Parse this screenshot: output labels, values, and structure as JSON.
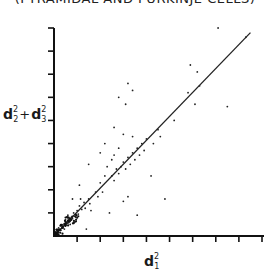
{
  "chart_data": {
    "type": "scatter",
    "title": "(PYRAMIDAL AND PURKINJE CELLS)",
    "xlabel": "d1^2",
    "ylabel": "d2^2 + d3^2",
    "xlim": [
      0,
      9
    ],
    "ylim": [
      0,
      9
    ],
    "x_ticks_count": 9,
    "y_ticks_count": 9,
    "tick_labels": "none",
    "grid": false,
    "legend": "none",
    "reference_line": {
      "type": "identity",
      "from": [
        0,
        0
      ],
      "to": [
        8.5,
        8.8
      ]
    },
    "points": [
      [
        0.1,
        0.1
      ],
      [
        0.15,
        0.2
      ],
      [
        0.2,
        0.15
      ],
      [
        0.25,
        0.3
      ],
      [
        0.3,
        0.25
      ],
      [
        0.35,
        0.4
      ],
      [
        0.4,
        0.35
      ],
      [
        0.45,
        0.5
      ],
      [
        0.5,
        0.45
      ],
      [
        0.55,
        0.6
      ],
      [
        0.6,
        0.55
      ],
      [
        0.65,
        0.7
      ],
      [
        0.7,
        0.65
      ],
      [
        0.75,
        0.8
      ],
      [
        0.8,
        0.75
      ],
      [
        0.3,
        0.45
      ],
      [
        0.45,
        0.3
      ],
      [
        0.2,
        0.35
      ],
      [
        0.5,
        0.7
      ],
      [
        0.7,
        0.5
      ],
      [
        0.85,
        1.0
      ],
      [
        0.9,
        0.85
      ],
      [
        1.0,
        1.1
      ],
      [
        1.05,
        0.95
      ],
      [
        1.1,
        1.3
      ],
      [
        1.2,
        1.15
      ],
      [
        1.3,
        1.45
      ],
      [
        1.35,
        1.2
      ],
      [
        1.5,
        1.6
      ],
      [
        1.55,
        1.4
      ],
      [
        0.6,
        0.9
      ],
      [
        0.9,
        0.6
      ],
      [
        1.15,
        1.6
      ],
      [
        1.6,
        1.1
      ],
      [
        1.8,
        1.9
      ],
      [
        1.9,
        1.7
      ],
      [
        2.0,
        2.3
      ],
      [
        2.1,
        1.9
      ],
      [
        1.4,
        0.3
      ],
      [
        2.4,
        1.0
      ],
      [
        2.5,
        2.6
      ],
      [
        2.6,
        2.4
      ],
      [
        2.7,
        2.9
      ],
      [
        2.8,
        2.7
      ],
      [
        2.9,
        3.0
      ],
      [
        3.0,
        3.2
      ],
      [
        3.1,
        2.9
      ],
      [
        3.2,
        3.4
      ],
      [
        3.3,
        3.1
      ],
      [
        3.4,
        3.6
      ],
      [
        2.2,
        2.6
      ],
      [
        2.3,
        3.0
      ],
      [
        2.5,
        3.3
      ],
      [
        2.0,
        3.6
      ],
      [
        2.2,
        4.0
      ],
      [
        3.5,
        3.3
      ],
      [
        3.6,
        3.8
      ],
      [
        3.7,
        3.5
      ],
      [
        3.8,
        4.0
      ],
      [
        3.9,
        3.7
      ],
      [
        3.2,
        1.7
      ],
      [
        3.0,
        4.4
      ],
      [
        3.4,
        4.3
      ],
      [
        2.8,
        3.8
      ],
      [
        2.6,
        3.5
      ],
      [
        4.2,
        2.6
      ],
      [
        4.0,
        4.2
      ],
      [
        4.3,
        4.0
      ],
      [
        4.5,
        4.6
      ],
      [
        4.6,
        4.3
      ],
      [
        2.8,
        6.0
      ],
      [
        3.2,
        6.6
      ],
      [
        3.4,
        6.3
      ],
      [
        3.1,
        5.7
      ],
      [
        5.8,
        6.2
      ],
      [
        6.1,
        5.7
      ],
      [
        5.9,
        7.4
      ],
      [
        6.2,
        7.1
      ],
      [
        7.5,
        5.6
      ],
      [
        7.1,
        9.0
      ],
      [
        3.0,
        1.5
      ],
      [
        4.8,
        1.6
      ],
      [
        5.2,
        5.0
      ],
      [
        1.5,
        3.1
      ],
      [
        2.6,
        4.7
      ],
      [
        1.1,
        2.2
      ],
      [
        0.8,
        1.6
      ],
      [
        6.3,
        6.5
      ],
      [
        8.3,
        8.6
      ],
      [
        3.6,
        0.9
      ]
    ]
  }
}
